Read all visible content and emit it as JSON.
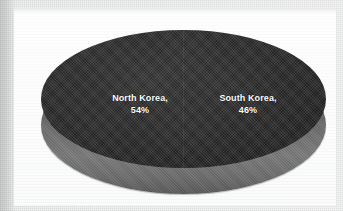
{
  "chart_data": {
    "type": "pie",
    "title": "",
    "three_d": true,
    "legend_position": "none",
    "labels_on_slices": true,
    "categories": [
      "North Korea",
      "South Korea"
    ],
    "values": [
      54,
      46
    ],
    "value_unit": "%",
    "slices": [
      {
        "name": "North Korea",
        "value": 54,
        "label_name": "North Korea,",
        "label_value": "54%",
        "color": "#262626",
        "side_color": "#6e6e6e"
      },
      {
        "name": "South Korea",
        "value": 46,
        "label_name": "South Korea,",
        "label_value": "46%",
        "color": "#242424",
        "side_color": "#6e6e6e"
      }
    ]
  },
  "style": {
    "plot_background": "#fbfbfb",
    "page_background": "#e9eaea",
    "label_color": "#ffffff"
  }
}
